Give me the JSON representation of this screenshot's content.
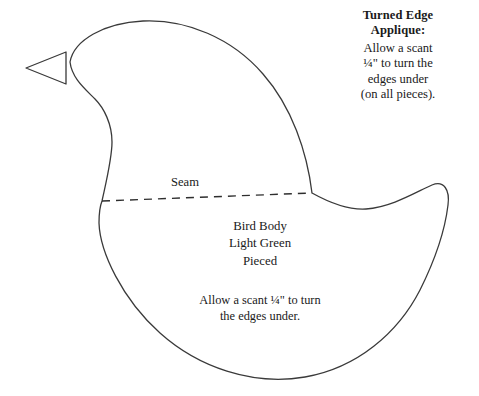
{
  "document": {
    "type": "quilt-applique-pattern",
    "subject": "bird body pattern piece",
    "background_color": "#ffffff",
    "outline_color": "#3a3a3a",
    "text_color": "#1a1a1a"
  },
  "side_note": {
    "heading_line1": "Turned Edge",
    "heading_line2": "Applique:",
    "body_line1": "Allow a scant",
    "body_line2": "¼\" to turn the",
    "body_line3": "edges under",
    "body_line4": "(on all pieces)."
  },
  "seam": {
    "label": "Seam",
    "style": "dashed",
    "from": [
      102,
      201
    ],
    "to": [
      312,
      193
    ]
  },
  "body_label": {
    "line1": "Bird Body",
    "line2": "Light Green",
    "line3": "Pieced"
  },
  "body_note": {
    "line1": "Allow a scant ¼\" to turn",
    "line2": "the edges under."
  },
  "shapes": {
    "beak": {
      "name": "beak-triangle",
      "points": "26,68 66,52 66,84"
    },
    "bird_body": {
      "name": "bird-body-outline",
      "path": "M 70,62 C 74,40 104,23 143,21 C 186,19 232,38 263,74 C 292,107 307,152 312,193 C 330,203 350,210 366,209 C 392,207 416,192 432,185 C 444,180 450,190 448,205 C 445,230 434,262 420,290 C 398,333 357,368 305,377 C 252,386 198,367 160,333 C 122,299 100,252 99,223 C 99,214 100,206 102,201 C 107,178 112,158 112,142 C 112,124 104,108 95,99 C 84,88 72,78 70,62 Z"
    }
  }
}
